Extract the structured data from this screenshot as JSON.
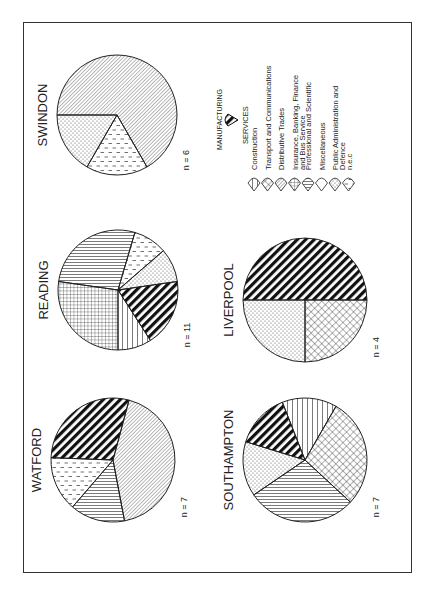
{
  "chart_data": {
    "type": "pie",
    "orientation_note": "figure printed rotated 90 degrees clockwise",
    "legend": {
      "manufacturing_label": "MANUFACTURING",
      "services_label": "SERVICES",
      "items": [
        {
          "key": "construction",
          "label": "Construction",
          "pattern": "horizontal"
        },
        {
          "key": "transport",
          "label": "Transport and Communications",
          "pattern": "crosshatch"
        },
        {
          "key": "distributive",
          "label": "Distributive Trades",
          "pattern": "diagonal"
        },
        {
          "key": "insurance",
          "label": "Insurance, Banking, Finance and Bus Service",
          "pattern": "grid"
        },
        {
          "key": "professional",
          "label": "Professional and Scientific",
          "pattern": "vertical"
        },
        {
          "key": "misc",
          "label": "Miscellaneous",
          "pattern": "blank"
        },
        {
          "key": "public",
          "label": "Public Administration and Defence",
          "pattern": "dots"
        },
        {
          "key": "nec",
          "label": "n.e.c",
          "pattern": "dashes"
        }
      ]
    },
    "pies": [
      {
        "name": "SWINDON",
        "n": "n = 6",
        "slices": [
          {
            "cat": "distributive",
            "value": 4
          },
          {
            "cat": "nec",
            "value": 1
          },
          {
            "cat": "public",
            "value": 1
          }
        ]
      },
      {
        "name": "READING",
        "n": "n = 11",
        "slices": [
          {
            "cat": "insurance",
            "value": 3
          },
          {
            "cat": "professional",
            "value": 3
          },
          {
            "cat": "nec",
            "value": 1
          },
          {
            "cat": "public",
            "value": 1
          },
          {
            "cat": "manufacturing",
            "value": 2
          },
          {
            "cat": "construction",
            "value": 1
          }
        ]
      },
      {
        "name": "WATFORD",
        "n": "n = 7",
        "slices": [
          {
            "cat": "distributive",
            "value": 3
          },
          {
            "cat": "professional",
            "value": 1
          },
          {
            "cat": "nec",
            "value": 1
          },
          {
            "cat": "manufacturing",
            "value": 2
          }
        ]
      },
      {
        "name": "LIVERPOOL",
        "n": "n = 4",
        "slices": [
          {
            "cat": "transport",
            "value": 1
          },
          {
            "cat": "public",
            "value": 1
          },
          {
            "cat": "manufacturing",
            "value": 2
          }
        ]
      },
      {
        "name": "SOUTHAMPTON",
        "n": "n = 7",
        "slices": [
          {
            "cat": "transport",
            "value": 2
          },
          {
            "cat": "professional",
            "value": 2
          },
          {
            "cat": "public",
            "value": 1
          },
          {
            "cat": "manufacturing",
            "value": 1
          },
          {
            "cat": "construction",
            "value": 1
          }
        ]
      }
    ]
  }
}
